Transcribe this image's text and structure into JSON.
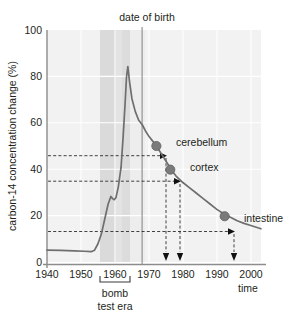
{
  "chart_data": {
    "type": "line",
    "title": "",
    "xlabel": "time",
    "ylabel": "carbon-14 concentration change (%)",
    "xlim": [
      1940,
      2003
    ],
    "ylim": [
      -8,
      100
    ],
    "grid": true,
    "legend": "none",
    "xticks": [
      "1940",
      "1950",
      "1960",
      "1970",
      "1980",
      "1990",
      "2000"
    ],
    "xtick_values": [
      1940,
      1950,
      1960,
      1970,
      1980,
      1990,
      2000
    ],
    "yticks": [
      "0",
      "20",
      "40",
      "60",
      "80",
      "100"
    ],
    "ytick_values": [
      0,
      20,
      40,
      60,
      80,
      100
    ],
    "series": [
      {
        "name": "atmospheric carbon-14",
        "x": [
          1940,
          1944,
          1948,
          1951,
          1953,
          1954,
          1955,
          1956,
          1957,
          1958,
          1958.8,
          1959.3,
          1959.8,
          1960.3,
          1961,
          1961.8,
          1962.4,
          1963,
          1963.4,
          1963.8,
          1964.3,
          1965,
          1966,
          1967,
          1968,
          1969,
          1970,
          1971,
          1972,
          1973,
          1974,
          1975,
          1976,
          1977,
          1978,
          1980,
          1982,
          1984,
          1986,
          1988,
          1990,
          1992,
          1994,
          1996,
          1998,
          2000,
          2003
        ],
        "y": [
          -2.5,
          -2.6,
          -2.8,
          -3.0,
          -3.2,
          -2.5,
          0.5,
          5,
          12,
          19,
          22.5,
          21.5,
          21,
          22,
          27,
          36,
          50,
          66,
          78,
          83,
          76,
          68,
          62,
          58,
          56,
          53,
          50.5,
          48.5,
          46.5,
          44,
          41.5,
          39,
          36.5,
          34,
          32,
          29,
          26.5,
          24,
          21.5,
          19,
          16.5,
          14.5,
          12.8,
          11.2,
          10,
          9,
          7.5
        ]
      }
    ],
    "shaded_band": {
      "label": "bomb test era",
      "x_start": 1955.5,
      "x_end": 1964.3
    },
    "birth_line": {
      "label": "date of birth",
      "x": 1968
    },
    "annotations": [
      {
        "label": "cerebellum",
        "x": 1972.2,
        "y": 46
      },
      {
        "label": "cortex",
        "x": 1976.3,
        "y": 35
      },
      {
        "label": "intestine",
        "x": 1992.3,
        "y": 13.3
      }
    ],
    "colors": {
      "curve": "#6e6e6e",
      "plot_background": "#f2f2f2",
      "band": "#dcdcdc",
      "gridline": "#ffffff",
      "axis": "#808080",
      "marker": "#7a7a7a",
      "text": "#231f20"
    }
  }
}
